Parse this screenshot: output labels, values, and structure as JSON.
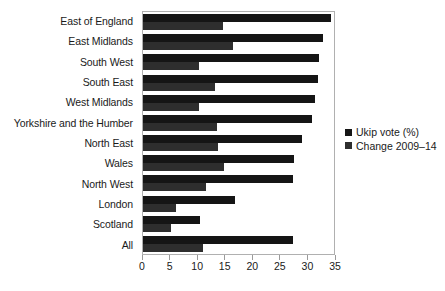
{
  "chart_data": {
    "type": "bar",
    "orientation": "horizontal",
    "title": "",
    "subtitle": "",
    "xlabel": "",
    "ylabel": "",
    "xlim": [
      0,
      35
    ],
    "xticks": [
      0,
      5,
      10,
      15,
      20,
      25,
      30,
      35
    ],
    "xtick_labels": [
      "0",
      "5",
      "10",
      "15",
      "20",
      "25",
      "30",
      "35"
    ],
    "grid": false,
    "legend_position": "right",
    "categories": [
      "East of England",
      "East Midlands",
      "South West",
      "South East",
      "West Midlands",
      "Yorkshire and the Humber",
      "North East",
      "Wales",
      "North West",
      "London",
      "Scotland",
      "All"
    ],
    "series": [
      {
        "name": "Ukip vote (%)",
        "color": "#151515",
        "values": [
          34.5,
          33.0,
          32.2,
          32.0,
          31.5,
          31.0,
          29.2,
          27.6,
          27.5,
          16.9,
          10.4,
          27.5
        ]
      },
      {
        "name": "Change 2009–14",
        "color": "#2e2e2e",
        "values": [
          14.7,
          16.5,
          10.2,
          13.2,
          10.2,
          13.6,
          13.7,
          14.8,
          11.5,
          6.0,
          5.2,
          11.0
        ]
      }
    ]
  },
  "legend": {
    "entries": [
      {
        "label": "Ukip vote (%)"
      },
      {
        "label": "Change 2009–14"
      }
    ]
  }
}
